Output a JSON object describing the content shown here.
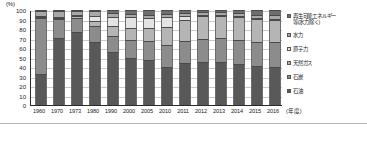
{
  "chart_data": {
    "type": "bar",
    "stacked": true,
    "stack_total": 100,
    "title": "",
    "subtitle": "",
    "xlabel": "(年度)",
    "ylabel": "(%)",
    "ylim": [
      0,
      100
    ],
    "ytick_labels": [
      "0",
      "10",
      "20",
      "30",
      "40",
      "50",
      "60",
      "70",
      "80",
      "90",
      "100"
    ],
    "ytick_values": [
      0,
      10,
      20,
      30,
      40,
      50,
      60,
      70,
      80,
      90,
      100
    ],
    "grid": true,
    "grid_axis": "y",
    "legend_position": "right",
    "categories": [
      "1960",
      "1970",
      "1973",
      "1980",
      "1990",
      "2000",
      "2005",
      "2010",
      "2011",
      "2012",
      "2013",
      "2014",
      "2015",
      "2016"
    ],
    "series": [
      {
        "name": "石油",
        "color": "#595959",
        "values": [
          33,
          71,
          77,
          66,
          56,
          50,
          47,
          40,
          44,
          45,
          46,
          44,
          42,
          40
        ]
      },
      {
        "name": "石炭",
        "color": "#8c8c8c",
        "values": [
          60,
          21,
          15,
          17,
          17,
          18,
          20,
          23,
          23,
          25,
          25,
          25,
          25,
          26
        ]
      },
      {
        "name": "天然ガス",
        "color": "#b5b5b5",
        "values": [
          1,
          1,
          2,
          6,
          10,
          13,
          14,
          19,
          23,
          24,
          24,
          25,
          24,
          24
        ]
      },
      {
        "name": "原子力",
        "color": "#e3e3e3",
        "values": [
          0,
          0,
          1,
          5,
          10,
          12,
          11,
          11,
          4,
          1,
          0,
          0,
          0,
          1
        ]
      },
      {
        "name": "水力",
        "color": "#a8a8a8",
        "values": [
          5,
          6,
          4,
          5,
          4,
          3,
          3,
          3,
          3,
          3,
          3,
          3,
          4,
          4
        ]
      },
      {
        "name": "再生可能エネルギー等(水力除く)",
        "color": "#6e6e6e",
        "values": [
          1,
          1,
          1,
          1,
          3,
          4,
          5,
          4,
          3,
          2,
          2,
          3,
          5,
          5
        ]
      }
    ],
    "legend_entries": [
      {
        "label": "再生可能エネルギー\n等(水力除く)",
        "color": "#6e6e6e",
        "marker": "legend-swatch-renewable"
      },
      {
        "label": "水力",
        "color": "#a8a8a8",
        "marker": "legend-swatch-hydro"
      },
      {
        "label": "原子力",
        "color": "#e3e3e3",
        "marker": "legend-swatch-nuclear"
      },
      {
        "label": "天然ガス",
        "color": "#b5b5b5",
        "marker": "legend-swatch-natural-gas"
      },
      {
        "label": "石炭",
        "color": "#8c8c8c",
        "marker": "legend-swatch-coal"
      },
      {
        "label": "石油",
        "color": "#595959",
        "marker": "legend-swatch-oil"
      }
    ]
  }
}
